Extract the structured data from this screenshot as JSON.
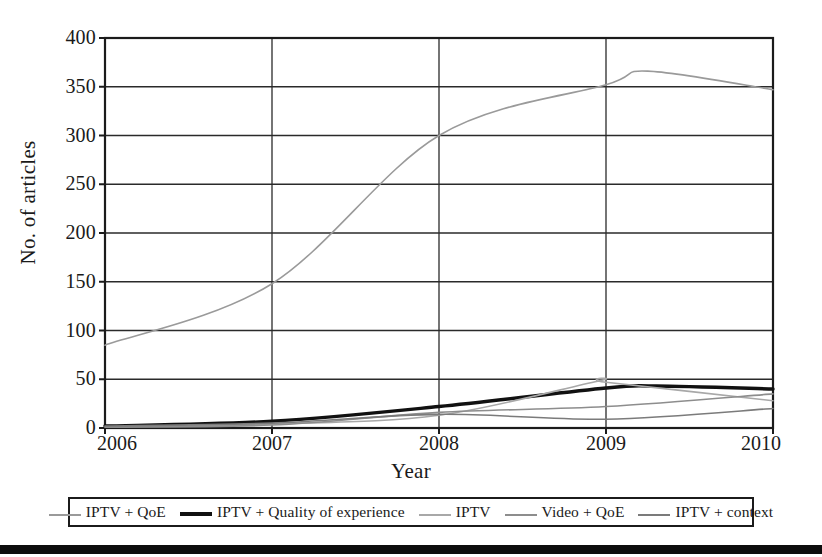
{
  "chart_data": {
    "type": "line",
    "title": "",
    "xlabel": "Year",
    "ylabel": "No. of articles",
    "x": [
      2006,
      2007,
      2008,
      2009,
      2010
    ],
    "xlim": [
      2006,
      2010
    ],
    "ylim": [
      0,
      400
    ],
    "xticks": [
      "2006",
      "2007",
      "2008",
      "2009",
      "2010"
    ],
    "yticks": [
      "0",
      "50",
      "100",
      "150",
      "200",
      "250",
      "300",
      "350",
      "400"
    ],
    "ytick_values": [
      0,
      50,
      100,
      150,
      200,
      250,
      300,
      350,
      400
    ],
    "grid": "horizontal-and-vertical",
    "legend_position": "below-axes",
    "series": [
      {
        "name": "IPTV + QoE",
        "color": "#9a9a9a",
        "width": 1.6,
        "values": [
          85,
          148,
          300,
          352,
          347
        ],
        "peak_value": 366,
        "peak_x": 2009.25
      },
      {
        "name": "IPTV + Quality of experience",
        "color": "#111111",
        "width": 3.4,
        "values": [
          2,
          7,
          22,
          41,
          40
        ],
        "peak_value": 43,
        "peak_x": 2009.3
      },
      {
        "name": "IPTV",
        "color": "#a8a8a8",
        "width": 1.6,
        "values": [
          1,
          4,
          13,
          47,
          28
        ],
        "peak_value": 48,
        "peak_x": 2008.95
      },
      {
        "name": "Video + QoE",
        "color": "#8d8d8d",
        "width": 1.6,
        "values": [
          1,
          3,
          16,
          22,
          35
        ],
        "peak_value": 35,
        "peak_x": 2010
      },
      {
        "name": "IPTV + context",
        "color": "#7b7b7b",
        "width": 1.6,
        "values": [
          2,
          5,
          14,
          9,
          20
        ],
        "peak_value": 20,
        "peak_x": 2010
      }
    ]
  },
  "axes": {
    "y_title": "No. of articles",
    "x_title": "Year"
  },
  "legend": {
    "items": [
      {
        "label": "IPTV + QoE"
      },
      {
        "label": "IPTV + Quality of experience"
      },
      {
        "label": "IPTV"
      },
      {
        "label": "Video + QoE"
      },
      {
        "label": "IPTV + context"
      }
    ]
  },
  "colors": {
    "frame": "#1b1b1b",
    "grid": "#2a2a2a",
    "background": "#ffffff",
    "footer_bar": "#0d0d0d"
  }
}
